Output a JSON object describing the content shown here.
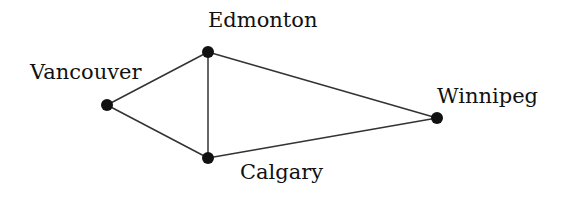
{
  "diagram": {
    "type": "graph",
    "nodes": [
      {
        "id": "vancouver",
        "label": "Vancouver",
        "x": 107,
        "y": 105,
        "label_x": 30,
        "label_y": 62
      },
      {
        "id": "edmonton",
        "label": "Edmonton",
        "x": 208,
        "y": 52,
        "label_x": 208,
        "label_y": 10
      },
      {
        "id": "calgary",
        "label": "Calgary",
        "x": 208,
        "y": 158,
        "label_x": 240,
        "label_y": 162
      },
      {
        "id": "winnipeg",
        "label": "Winnipeg",
        "x": 437,
        "y": 118,
        "label_x": 437,
        "label_y": 86
      }
    ],
    "edges": [
      {
        "from": "vancouver",
        "to": "edmonton"
      },
      {
        "from": "vancouver",
        "to": "calgary"
      },
      {
        "from": "edmonton",
        "to": "calgary"
      },
      {
        "from": "edmonton",
        "to": "winnipeg"
      },
      {
        "from": "calgary",
        "to": "winnipeg"
      }
    ],
    "colors": {
      "edge": "#333333",
      "node": "#111111"
    }
  }
}
